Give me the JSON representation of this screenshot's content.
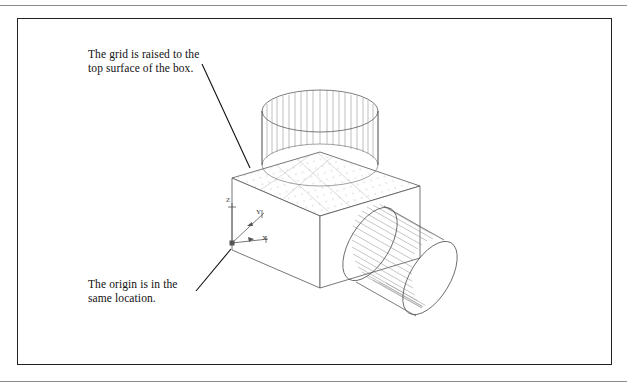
{
  "page": {
    "background_color": "#ffffff",
    "border_color": "#222222",
    "rule_color": "#8a8a8a"
  },
  "annotations": {
    "grid_note": {
      "text": "The grid is raised to the\ntop surface of the box.",
      "leader_from": [
        202,
        64
      ],
      "leader_to": [
        250,
        168
      ]
    },
    "origin_note": {
      "text": "The origin is in the\nsame location.",
      "leader_from": [
        196,
        291
      ],
      "leader_to": [
        231,
        249
      ]
    }
  },
  "ucs_icon": {
    "name": "ucs-axis-icon",
    "origin": [
      232,
      243
    ],
    "axes": [
      {
        "label": "Z",
        "direction": "up",
        "tip": [
          232,
          202
        ]
      },
      {
        "label": "Y",
        "direction": "upper-right",
        "tip": [
          264,
          213
        ]
      },
      {
        "label": "X",
        "direction": "lower-right",
        "tip": [
          268,
          238
        ]
      }
    ]
  },
  "drawing": {
    "type": "isometric-wireframe",
    "line_color": "#4a4a4a",
    "grid_dot_color": "#9a9a9a",
    "objects": [
      {
        "name": "box",
        "top_face_corners": [
          [
            232,
            178
          ],
          [
            320,
            152
          ],
          [
            420,
            186
          ],
          [
            320,
            216
          ]
        ],
        "height": 72,
        "grid_on_top_surface": true
      },
      {
        "name": "vertical-cylinder",
        "axis": "Z",
        "top_ellipse_center": [
          320,
          111
        ],
        "bottom_ellipse_center": [
          320,
          165
        ],
        "radius_x": 58,
        "radius_y": 21,
        "generator_count": 24
      },
      {
        "name": "horizontal-cylinder",
        "axis": "X",
        "near_ellipse_center": [
          370,
          245
        ],
        "far_ellipse_center": [
          430,
          279
        ],
        "radius": 42,
        "generator_count": 26
      }
    ]
  }
}
